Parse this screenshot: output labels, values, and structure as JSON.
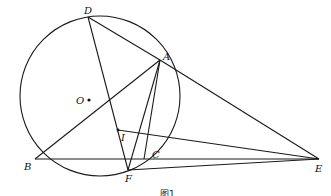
{
  "figure": {
    "caption": "图1",
    "circle": {
      "center_label": "O",
      "cx": 100,
      "cy": 96,
      "r": 80
    },
    "points": {
      "D": {
        "x": 88,
        "y": 17,
        "label": "D"
      },
      "A": {
        "x": 160,
        "y": 60,
        "label": "A"
      },
      "B": {
        "x": 35,
        "y": 159,
        "label": "B"
      },
      "C": {
        "x": 144,
        "y": 159,
        "label": "C"
      },
      "F": {
        "x": 128,
        "y": 170,
        "label": "F"
      },
      "I": {
        "x": 118,
        "y": 130,
        "label": "I"
      },
      "E": {
        "x": 319,
        "y": 159,
        "label": "E"
      },
      "O": {
        "x": 89,
        "y": 100,
        "label": "O"
      }
    },
    "segments": [
      "DA",
      "AE",
      "DF",
      "AB",
      "AC",
      "AF",
      "BE",
      "FE",
      "IE"
    ]
  }
}
